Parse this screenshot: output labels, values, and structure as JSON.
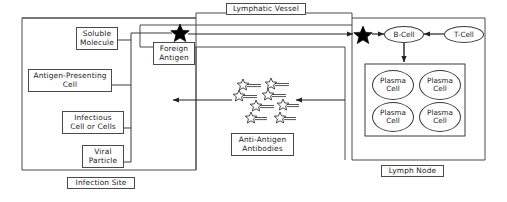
{
  "diagram": {
    "regions": {
      "infection_site": {
        "label": "Infection Site"
      },
      "lymphatic_vessel": {
        "label": "Lymphatic Vessel"
      },
      "lymph_node": {
        "label": "Lymph Node"
      }
    },
    "infection_site_items": [
      {
        "id": "soluble-molecule",
        "label": "Soluble\nMolecule",
        "line1": "Soluble",
        "line2": "Molecule"
      },
      {
        "id": "antigen-presenting-cell",
        "label": "Antigen-Presenting\nCell",
        "line1": "Antigen-Presenting",
        "line2": "Cell"
      },
      {
        "id": "infectious-cell-or-cells",
        "label": "Infectious\nCell or Cells",
        "line1": "Infectious",
        "line2": "Cell or Cells"
      },
      {
        "id": "viral-particle",
        "label": "Viral\nParticle",
        "line1": "Viral",
        "line2": "Particle"
      }
    ],
    "foreign_antigen": {
      "line1": "Foreign",
      "line2": "Antigen",
      "icon": "star-icon"
    },
    "antibodies": {
      "line1": "Anti-Antigen",
      "line2": "Antibodies",
      "count": 8,
      "icon": "antibody-star-icon"
    },
    "lymph_node_cells": {
      "b_cell": {
        "label": "B-Cell"
      },
      "t_cell": {
        "label": "T-Cell"
      },
      "plasma_cells": [
        {
          "line1": "Plasma",
          "line2": "Cell"
        },
        {
          "line1": "Plasma",
          "line2": "Cell"
        },
        {
          "line1": "Plasma",
          "line2": "Cell"
        },
        {
          "line1": "Plasma",
          "line2": "Cell"
        }
      ]
    },
    "stars": [
      {
        "id": "antigen-star-left",
        "x": 180,
        "y": 31
      },
      {
        "id": "antigen-star-right",
        "x": 363,
        "y": 34
      }
    ],
    "colors": {
      "stroke": "#3a3a3a",
      "box_border": "#4a4a4a",
      "text": "#1b1b1b",
      "background": "#ffffff",
      "star_fill": "#000000"
    }
  }
}
